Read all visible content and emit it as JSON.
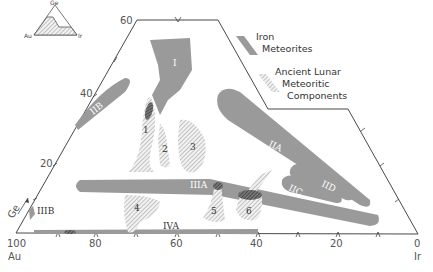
{
  "diagram": {
    "type": "ternary-composition-diagram",
    "vertices": {
      "top": "Ge",
      "left": "Au",
      "right": "Ir"
    },
    "inset": {
      "labels": {
        "top": "Ge",
        "left": "Au",
        "right": "Ir"
      }
    },
    "axis_labels": {
      "left_edge": [
        "20",
        "40",
        "60"
      ],
      "bottom_edge": [
        "100",
        "80",
        "60",
        "40",
        "20",
        "0"
      ],
      "ge_arrow": "Ge",
      "au": "Au",
      "ir": "Ir"
    },
    "legend": {
      "iron": {
        "line1": "Iron",
        "line2": "Meteorites"
      },
      "lunar": {
        "line1": "Ancient Lunar",
        "line2": "Meteoritic",
        "line3": "Components"
      }
    },
    "iron_groups": [
      "I",
      "IIB",
      "IIA",
      "IIIA",
      "IIC",
      "IID",
      "IIIB",
      "IVA"
    ],
    "lunar_components": [
      "1",
      "2",
      "3",
      "4",
      "5",
      "6"
    ],
    "colors": {
      "iron_fill": "#9a9a9a",
      "lunar_hatch": "#a8a8a8",
      "overlap": "#555555",
      "outline": "#333333"
    }
  }
}
